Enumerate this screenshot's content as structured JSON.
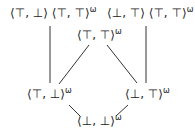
{
  "diagram": {
    "type": "hasse-diagram",
    "nodes": [
      {
        "id": "tl",
        "base": "⟨⊤, ⊥⟩ ⟨⊤, ⊤⟩",
        "sup": "ω"
      },
      {
        "id": "tr",
        "base": "⟨⊥, ⊤⟩ ⟨⊤, ⊤⟩",
        "sup": "ω"
      },
      {
        "id": "top",
        "base": "⟨⊤, ⊤⟩",
        "sup": "ω"
      },
      {
        "id": "ml",
        "base": "⟨⊤, ⊥⟩",
        "sup": "ω"
      },
      {
        "id": "mr",
        "base": "⟨⊥, ⊤⟩",
        "sup": "ω"
      },
      {
        "id": "bot",
        "base": "⟨⊥, ⊥⟩",
        "sup": "ω"
      }
    ],
    "edges": [
      [
        "tl",
        "ml"
      ],
      [
        "tr",
        "mr"
      ],
      [
        "top",
        "ml"
      ],
      [
        "top",
        "mr"
      ],
      [
        "ml",
        "bot"
      ],
      [
        "mr",
        "bot"
      ]
    ]
  }
}
